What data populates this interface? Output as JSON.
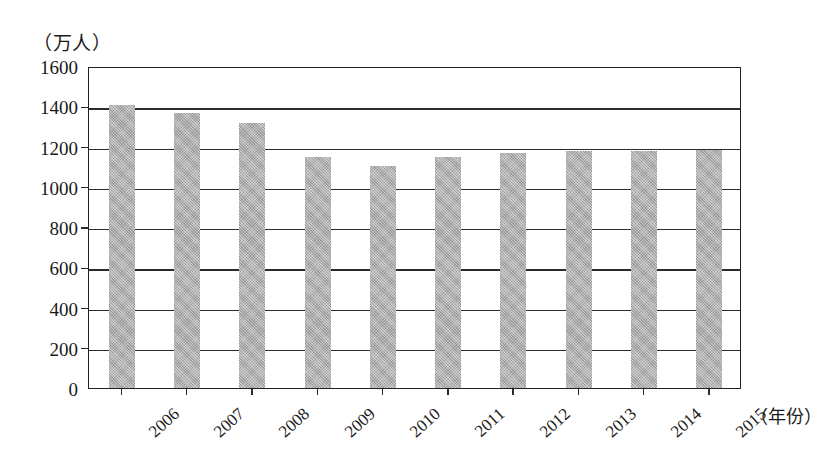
{
  "chart_data": {
    "type": "bar",
    "title": "",
    "unit_label": "（万人）",
    "xlabel": "（年份）",
    "ylabel": "",
    "ylim": [
      0,
      1600
    ],
    "ytick_step": 200,
    "grid": true,
    "legend": "none",
    "bar_color": "#a9a9a9",
    "axis_color": "#2b2b2b",
    "categories": [
      "2006",
      "2007",
      "2008",
      "2009",
      "2010",
      "2011",
      "2012",
      "2013",
      "2014",
      "2015"
    ],
    "values": [
      1405,
      1365,
      1315,
      1150,
      1105,
      1150,
      1170,
      1180,
      1180,
      1185
    ],
    "ytick_labels": [
      "1600",
      "1400",
      "1200",
      "1000",
      "800",
      "600",
      "400",
      "200",
      "0"
    ],
    "ytick_values": [
      1600,
      1400,
      1200,
      1000,
      800,
      600,
      400,
      200,
      0
    ]
  }
}
